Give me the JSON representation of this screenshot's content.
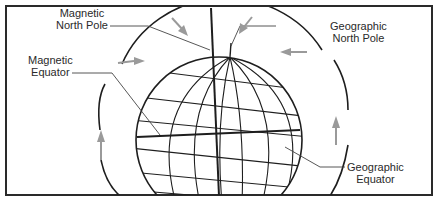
{
  "diagram": {
    "title": "",
    "labels": {
      "magnetic_north_pole": [
        "Magnetic",
        "North Pole"
      ],
      "magnetic_equator": [
        "Magnetic",
        "Equator"
      ],
      "geographic_north_pole": [
        "Geographic",
        "North Pole"
      ],
      "geographic_equator": [
        "Geographic",
        "Equator"
      ]
    },
    "colors": {
      "line": "#1e1e1e",
      "arrow": "#9a9a9a",
      "leader": "#444444",
      "background": "#ffffff"
    },
    "elements": {
      "globe": "Earth sphere with latitude/longitude grid",
      "field_lines": "Magnetic field arcs with gray direction arrows",
      "axis": "Magnetic axis (vertical heavy line)"
    }
  }
}
